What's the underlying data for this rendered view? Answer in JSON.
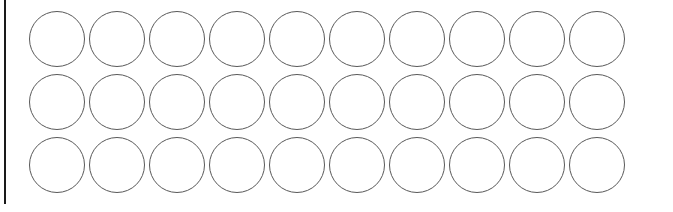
{
  "canvas": {
    "width": 673,
    "height": 212,
    "background_color": "#ffffff"
  },
  "left_rule": {
    "name": "left-vertical-rule",
    "color": "#1a1a1a",
    "x": 4,
    "y": 0,
    "width": 2,
    "height": 204
  },
  "grid": {
    "title": "",
    "columns": 10,
    "rows": 3,
    "shape": "circle",
    "circle_diameter": 56,
    "stroke_color": "#595959",
    "stroke_width": 1,
    "fill_color": "#ffffff",
    "column_pitch": 60,
    "row_pitch": 63,
    "origin_x": 29,
    "origin_y": 11,
    "row_y": [
      11,
      74,
      137
    ],
    "column_x": [
      29,
      89,
      149,
      209,
      269,
      329,
      389,
      449,
      509,
      569
    ],
    "cells": [
      {
        "row": 0,
        "label": "",
        "items": [
          {
            "col": 0,
            "label": "",
            "filled": false
          },
          {
            "col": 1,
            "label": "",
            "filled": false
          },
          {
            "col": 2,
            "label": "",
            "filled": false
          },
          {
            "col": 3,
            "label": "",
            "filled": false
          },
          {
            "col": 4,
            "label": "",
            "filled": false
          },
          {
            "col": 5,
            "label": "",
            "filled": false
          },
          {
            "col": 6,
            "label": "",
            "filled": false
          },
          {
            "col": 7,
            "label": "",
            "filled": false
          },
          {
            "col": 8,
            "label": "",
            "filled": false
          },
          {
            "col": 9,
            "label": "",
            "filled": false
          }
        ]
      },
      {
        "row": 1,
        "label": "",
        "items": [
          {
            "col": 0,
            "label": "",
            "filled": false
          },
          {
            "col": 1,
            "label": "",
            "filled": false
          },
          {
            "col": 2,
            "label": "",
            "filled": false
          },
          {
            "col": 3,
            "label": "",
            "filled": false
          },
          {
            "col": 4,
            "label": "",
            "filled": false
          },
          {
            "col": 5,
            "label": "",
            "filled": false
          },
          {
            "col": 6,
            "label": "",
            "filled": false
          },
          {
            "col": 7,
            "label": "",
            "filled": false
          },
          {
            "col": 8,
            "label": "",
            "filled": false
          },
          {
            "col": 9,
            "label": "",
            "filled": false
          }
        ]
      },
      {
        "row": 2,
        "label": "",
        "items": [
          {
            "col": 0,
            "label": "",
            "filled": false
          },
          {
            "col": 1,
            "label": "",
            "filled": false
          },
          {
            "col": 2,
            "label": "",
            "filled": false
          },
          {
            "col": 3,
            "label": "",
            "filled": false
          },
          {
            "col": 4,
            "label": "",
            "filled": false
          },
          {
            "col": 5,
            "label": "",
            "filled": false
          },
          {
            "col": 6,
            "label": "",
            "filled": false
          },
          {
            "col": 7,
            "label": "",
            "filled": false
          },
          {
            "col": 8,
            "label": "",
            "filled": false
          },
          {
            "col": 9,
            "label": "",
            "filled": false
          }
        ]
      }
    ]
  }
}
